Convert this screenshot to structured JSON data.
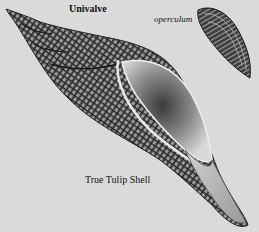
{
  "figure": {
    "title": "Univalve",
    "caption": "True Tulip Shell",
    "labels": {
      "operculum": "operculum"
    },
    "colors": {
      "background": "#dadada",
      "shell_dark": "#2a2a2a",
      "shell_mid": "#777777",
      "aperture_light": "#cfcfcf",
      "text": "#111111"
    }
  }
}
